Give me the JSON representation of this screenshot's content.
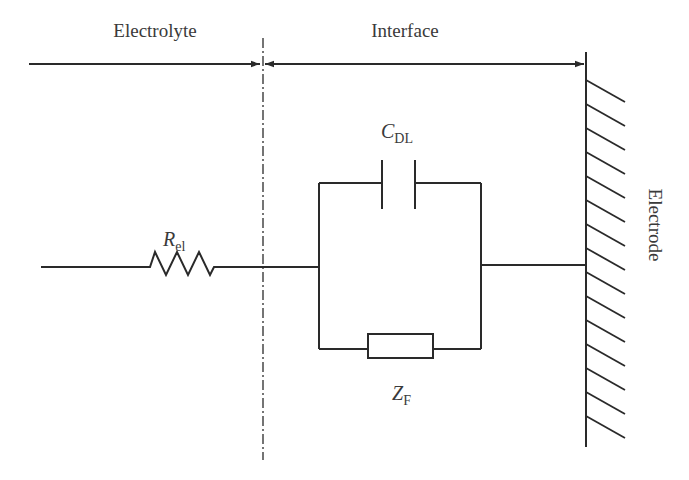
{
  "diagram": {
    "type": "equivalent-circuit",
    "regions": {
      "electrolyte_label": "Electrolyte",
      "interface_label": "Interface",
      "electrode_label": "Electrode"
    },
    "components": {
      "resistor": {
        "symbol": "R",
        "subscript": "el"
      },
      "capacitor": {
        "symbol": "C",
        "subscript": "DL"
      },
      "impedance": {
        "symbol": "Z",
        "subscript": "F"
      }
    },
    "colors": {
      "line": "#2a2a2a",
      "text": "#3a3a3a",
      "background": "#ffffff"
    }
  }
}
